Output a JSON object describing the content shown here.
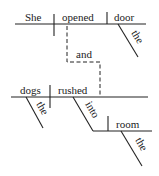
{
  "diagram": {
    "type": "Reed-Kellogg sentence diagram",
    "clause1": {
      "subject": "She",
      "verb": "opened",
      "object": "door",
      "object_modifier": "the"
    },
    "conjunction": "and",
    "clause2": {
      "subject": "dogs",
      "subject_modifier": "the",
      "verb": "rushed",
      "preposition": "into",
      "prep_object": "room",
      "prep_object_modifier": "the"
    }
  }
}
